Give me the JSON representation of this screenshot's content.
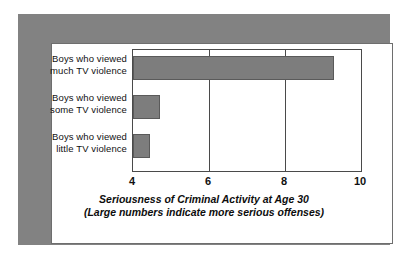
{
  "chart_data": {
    "type": "bar",
    "orientation": "horizontal",
    "title": "",
    "xlabel_line1": "Seriousness of Criminal Activity at Age 30",
    "xlabel_line2": "(Large numbers indicate more serious offenses)",
    "ylabel": "",
    "categories": [
      "Boys who viewed much TV violence",
      "Boys who viewed some TV violence",
      "Boys who viewed little TV violence"
    ],
    "category_lines": [
      [
        "Boys who viewed",
        "much TV violence"
      ],
      [
        "Boys who viewed",
        "some TV violence"
      ],
      [
        "Boys who viewed",
        "little TV violence"
      ]
    ],
    "values": [
      9.3,
      4.7,
      4.45
    ],
    "xlim": [
      4,
      10
    ],
    "xticks": [
      4,
      6,
      8,
      10
    ],
    "xtick_labels": [
      "4",
      "6",
      "8",
      "10"
    ],
    "gridlines_at": [
      6,
      8
    ],
    "grid": true,
    "legend": "none",
    "bar_color": "#7d7d7d",
    "bar_border_color": "#5a5a5a",
    "axis_color": "#4a4a4a",
    "frame_color": "#828282",
    "background_color": "#ffffff"
  }
}
